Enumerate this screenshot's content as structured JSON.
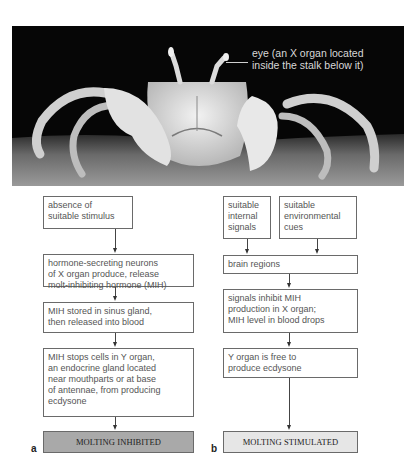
{
  "photo": {
    "subject": "ghost crab on sand at night",
    "annotation": "eye (an X organ located\ninside the stalk below it)",
    "annotation_line1": "eye (an X organ located",
    "annotation_line2": "inside the stalk below it)"
  },
  "panel_a": {
    "label": "a",
    "steps": [
      "absence of\nsuitable stimulus",
      "hormone-secreting neurons\nof X organ produce, release\nmolt-inhibiting hormone (MIH)",
      "MIH stored in sinus gland,\nthen released into blood",
      "MIH stops cells in Y organ,\nan endocrine gland located\nnear mouthparts or at base\nof antennae, from producing\necdysone"
    ],
    "result": "MOLTING INHIBITED",
    "result_color": "#a9a9a9"
  },
  "panel_b": {
    "label": "b",
    "inputs": [
      "suitable\ninternal\nsignals",
      "suitable\nenvironmental\ncues"
    ],
    "steps": [
      "brain regions",
      "signals inhibit MIH\nproduction in X organ;\nMIH level in blood drops",
      "Y organ is free to\nproduce ecdysone"
    ],
    "result": "MOLTING STIMULATED",
    "result_color": "#e6e6e6"
  }
}
